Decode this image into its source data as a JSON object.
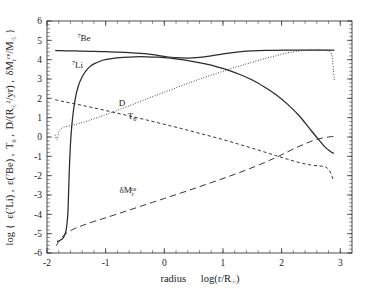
{
  "figure": {
    "width": 367,
    "height": 289,
    "background": "#ffffff",
    "ink_color": "#2b2b2b",
    "faint_title": ""
  },
  "chart_data": {
    "type": "line",
    "title": "",
    "xlabel": "radius   log(r/R⊙)",
    "ylabel": "log { ε(⁷Li) , ε(⁷Be) , T₆ , D/(R⊙²/yr) , δMᵣᶜᵉ/M⊙ }",
    "xlim": [
      -2,
      3.2
    ],
    "ylim": [
      -6,
      6
    ],
    "xticks": [
      -2,
      -1,
      0,
      1,
      2,
      3
    ],
    "yticks": [
      -6,
      -5,
      -4,
      -3,
      -2,
      -1,
      0,
      1,
      2,
      3,
      4,
      5,
      6
    ],
    "xtick_labels": [
      "-2",
      "-1",
      "0",
      "1",
      "2",
      "3"
    ],
    "ytick_labels": [
      "-6",
      "-5",
      "-4",
      "-3",
      "-2",
      "-1",
      "0",
      "1",
      "2",
      "3",
      "4",
      "5",
      "6"
    ],
    "minor_ticks_per_interval": 5,
    "grid": false,
    "legend": "inline-annotations",
    "tick_direction": "in",
    "series": [
      {
        "name": "7Be",
        "label": "⁷Be",
        "style": "solid",
        "label_x": -1.37,
        "label_y": 4.95,
        "x": [
          -1.86,
          -1.8,
          -1.7,
          -1.6,
          -1.5,
          -1.4,
          -1.2,
          -1.0,
          -0.8,
          -0.6,
          -0.4,
          -0.2,
          0.0,
          0.2,
          0.4,
          0.6,
          0.8,
          1.0,
          1.2,
          1.4,
          1.6,
          1.8,
          2.0,
          2.2,
          2.4,
          2.6,
          2.75,
          2.85,
          2.9
        ],
        "y": [
          4.47,
          4.47,
          4.46,
          4.46,
          4.45,
          4.44,
          4.43,
          4.41,
          4.39,
          4.36,
          4.32,
          4.26,
          4.17,
          4.1,
          4.08,
          4.12,
          4.2,
          4.3,
          4.38,
          4.44,
          4.47,
          4.48,
          4.49,
          4.49,
          4.49,
          4.49,
          4.49,
          4.49,
          4.49
        ]
      },
      {
        "name": "7Li",
        "label": "⁷Li",
        "style": "solid",
        "label_x": -1.48,
        "label_y": 3.55,
        "x": [
          -1.83,
          -1.78,
          -1.72,
          -1.68,
          -1.66,
          -1.645,
          -1.635,
          -1.625,
          -1.61,
          -1.59,
          -1.56,
          -1.52,
          -1.47,
          -1.4,
          -1.3,
          -1.2,
          -1.05,
          -0.9,
          -0.7,
          -0.5,
          -0.3,
          -0.1,
          0.1,
          0.3,
          0.5,
          0.7,
          0.9,
          1.1,
          1.3,
          1.5,
          1.7,
          1.9,
          2.1,
          2.3,
          2.5,
          2.65,
          2.75,
          2.82,
          2.86,
          2.89
        ],
        "y": [
          -5.4,
          -5.35,
          -5.2,
          -4.9,
          -4.5,
          -4.0,
          -3.2,
          -2.2,
          -1.0,
          0.1,
          1.1,
          1.95,
          2.6,
          3.12,
          3.55,
          3.78,
          3.97,
          4.06,
          4.12,
          4.15,
          4.15,
          4.13,
          4.08,
          4.0,
          3.9,
          3.78,
          3.63,
          3.45,
          3.22,
          2.95,
          2.6,
          2.2,
          1.7,
          1.1,
          0.35,
          -0.2,
          -0.55,
          -0.72,
          -0.8,
          -0.85
        ]
      },
      {
        "name": "D",
        "label": "D",
        "style": "dotted",
        "label_x": -0.72,
        "label_y": 1.62,
        "x": [
          -1.86,
          -1.83,
          -1.8,
          -1.76,
          -1.72,
          -1.65,
          -1.55,
          -1.45,
          -1.3,
          -1.1,
          -0.9,
          -0.7,
          -0.5,
          -0.3,
          -0.1,
          0.1,
          0.3,
          0.5,
          0.7,
          0.9,
          1.1,
          1.3,
          1.5,
          1.7,
          1.9,
          2.1,
          2.3,
          2.5,
          2.7,
          2.8,
          2.85,
          2.87,
          2.89,
          2.9
        ],
        "y": [
          0.12,
          -0.15,
          0.25,
          0.42,
          0.5,
          0.55,
          0.62,
          0.7,
          0.84,
          1.05,
          1.27,
          1.5,
          1.73,
          1.97,
          2.2,
          2.43,
          2.66,
          2.88,
          3.1,
          3.3,
          3.5,
          3.69,
          3.87,
          4.04,
          4.2,
          4.35,
          4.45,
          4.5,
          4.5,
          4.45,
          4.3,
          3.9,
          3.2,
          2.95
        ]
      },
      {
        "name": "T6",
        "label": "T₆",
        "style": "dashed",
        "label_x": -0.55,
        "label_y": 0.92,
        "x": [
          -1.86,
          -1.7,
          -1.5,
          -1.3,
          -1.1,
          -0.9,
          -0.7,
          -0.5,
          -0.3,
          -0.1,
          0.1,
          0.3,
          0.5,
          0.7,
          0.9,
          1.1,
          1.3,
          1.5,
          1.7,
          1.9,
          2.1,
          2.3,
          2.5,
          2.65,
          2.75,
          2.82,
          2.86,
          2.89
        ],
        "y": [
          1.93,
          1.82,
          1.7,
          1.57,
          1.44,
          1.3,
          1.16,
          1.02,
          0.88,
          0.73,
          0.58,
          0.43,
          0.27,
          0.11,
          -0.05,
          -0.22,
          -0.4,
          -0.58,
          -0.77,
          -0.96,
          -1.15,
          -1.32,
          -1.45,
          -1.5,
          -1.55,
          -1.75,
          -2.05,
          -2.3
        ]
      },
      {
        "name": "dMce",
        "label": "δMᵣᶜᵉ",
        "style": "longdash",
        "label_x": -0.62,
        "label_y": -2.92,
        "x": [
          -1.84,
          -1.8,
          -1.75,
          -1.7,
          -1.6,
          -1.5,
          -1.4,
          -1.3,
          -1.15,
          -1.0,
          -0.8,
          -0.6,
          -0.4,
          -0.2,
          0.0,
          0.2,
          0.4,
          0.6,
          0.8,
          1.0,
          1.2,
          1.4,
          1.6,
          1.8,
          2.0,
          2.2,
          2.4,
          2.6,
          2.8,
          2.9
        ],
        "y": [
          -5.62,
          -5.4,
          -5.2,
          -5.05,
          -4.85,
          -4.7,
          -4.58,
          -4.47,
          -4.32,
          -4.18,
          -3.98,
          -3.78,
          -3.58,
          -3.38,
          -3.18,
          -2.98,
          -2.78,
          -2.57,
          -2.36,
          -2.15,
          -1.93,
          -1.7,
          -1.46,
          -1.2,
          -0.92,
          -0.62,
          -0.35,
          -0.12,
          0.0,
          0.03
        ]
      }
    ]
  }
}
